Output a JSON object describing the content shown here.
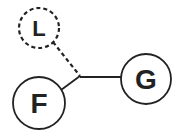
{
  "diagram": {
    "nodes": [
      {
        "id": "L",
        "label": "L",
        "style": "dashed"
      },
      {
        "id": "F",
        "label": "F",
        "style": "solid"
      },
      {
        "id": "G",
        "label": "G",
        "style": "solid"
      }
    ],
    "edges": [
      {
        "from": "L",
        "to": "junction",
        "style": "dashed"
      },
      {
        "from": "F",
        "to": "junction",
        "style": "solid"
      },
      {
        "from": "junction",
        "to": "G",
        "style": "solid"
      }
    ],
    "colors": {
      "stroke": "#222222",
      "background": "#ffffff"
    }
  }
}
